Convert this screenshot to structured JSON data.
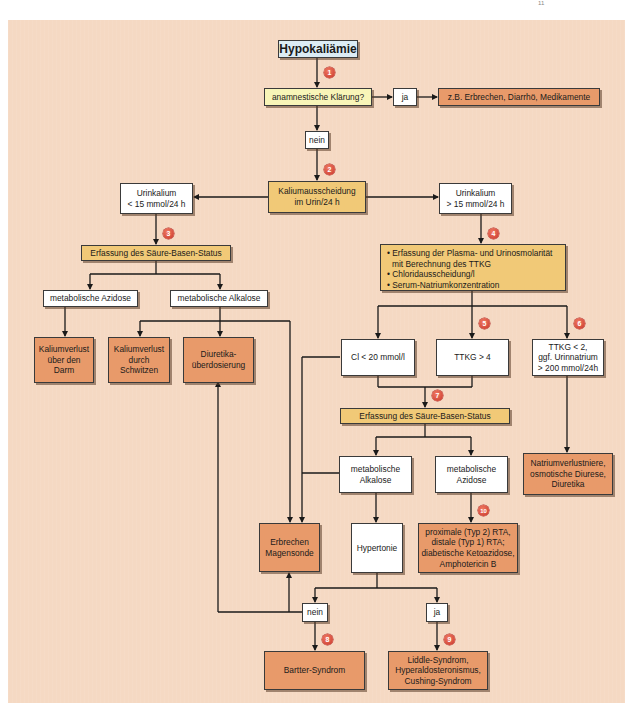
{
  "page_mark": "11",
  "colors": {
    "panel_bg": "#f5d9c3",
    "start_box": "#dcecf5",
    "question_box": "#f8f5b8",
    "step_box": "#f1c977",
    "result_box": "#e89a6a",
    "decision_box": "#ffffff",
    "badge": "#d9493a"
  },
  "nodes": {
    "start": "Hypokaliämie",
    "anamnesis": "anamnestische Klärung?",
    "anamnesis_yes": "ja",
    "anamnesis_causes": "z.B. Erbrechen, Diarrhö, Medikamente",
    "anamnesis_no": "nein",
    "potassium_excretion": [
      "Kaliumausscheidung",
      "im Urin/24 h"
    ],
    "urine_k_low": [
      "Urinkalium",
      "< 15 mmol/24 h"
    ],
    "urine_k_high": [
      "Urinkalium",
      "> 15 mmol/24 h"
    ],
    "acid_base_left": "Erfassung des Säure-Basen-Status",
    "met_acidosis_left": "metabolische Azidose",
    "met_alkalosis_left": "metabolische Alkalose",
    "loss_gut": [
      "Kaliumverlust",
      "über den",
      "Darm"
    ],
    "loss_sweat": [
      "Kaliumverlust",
      "durch",
      "Schwitzen"
    ],
    "diuretic_overdose": [
      "Diuretika-",
      "überdosierung"
    ],
    "workup_list": [
      "• Erfassung der Plasma- und Urinosmolarität",
      "  mit Berechnung des TTKG",
      "• Chloridausscheidung/l",
      "• Serum-Natriumkonzentration"
    ],
    "cl_low": "Cl < 20 mmol/l",
    "ttkg_high": "TTKG > 4",
    "ttkg_low": [
      "TTKG < 2,",
      "ggf. Urinnatrium",
      "> 200 mmol/24h"
    ],
    "acid_base_right": "Erfassung des Säure-Basen-Status",
    "met_alkalosis_right": [
      "metabolische",
      "Alkalose"
    ],
    "met_acidosis_right": [
      "metabolische",
      "Azidose"
    ],
    "sodium_loss": [
      "Natriumverlustniere,",
      "osmotische Diurese,",
      "Diuretika"
    ],
    "vomiting": [
      "Erbrechen",
      "Magensonde"
    ],
    "hypertension": "Hypertonie",
    "rta": [
      "proximale (Typ 2) RTA,",
      "distale (Typ 1) RTA;",
      "diabetische Ketoazidose,",
      "Amphotericin B"
    ],
    "hypertension_no": "nein",
    "hypertension_yes": "ja",
    "bartter": "Bartter-Syndrom",
    "liddle": [
      "Liddle-Syndrom,",
      "Hyperaldosteronismus,",
      "Cushing-Syndrom"
    ]
  },
  "badges": [
    "1",
    "2",
    "3",
    "4",
    "5",
    "6",
    "7",
    "8",
    "9",
    "10"
  ]
}
